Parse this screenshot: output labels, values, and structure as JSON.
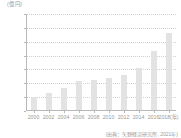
{
  "chart_data": {
    "type": "bar",
    "title": "",
    "subtitle": "",
    "unit_label": "(億 円)",
    "xlabel": "(年)",
    "ylabel": "",
    "categories": [
      "2000",
      "2002",
      "2004",
      "2006",
      "2008",
      "2010",
      "2012",
      "2014",
      "2016",
      "2018"
    ],
    "x_tick_labels": [
      "2000",
      "2002",
      "2004",
      "2006",
      "2008",
      "2010",
      "2012",
      "2014",
      "2016",
      "2018(年)"
    ],
    "values": [
      500,
      640,
      830,
      1100,
      1110,
      1180,
      1300,
      1550,
      2170,
      2830
    ],
    "y_tick_labels": [
      "0",
      "500",
      "1,000",
      "1,500",
      "2,000",
      "2,500",
      "3,000",
      "3,500"
    ],
    "y_ticks": [
      0,
      500,
      1000,
      1500,
      2000,
      2500,
      3000,
      3500
    ],
    "ylim": [
      0,
      3500
    ],
    "grid": true,
    "legend": false,
    "bar_color": "#e3e3e3",
    "axis_color": "#b8b8b8",
    "grid_color": "#cfcfcf",
    "text_color": "#9a9a9a",
    "source_note": "(出典：矢野経済研究所, 2021年)"
  }
}
